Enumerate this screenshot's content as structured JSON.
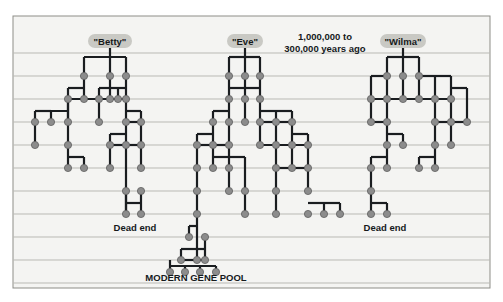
{
  "figure": {
    "title_caption": "Human mitochondrial lineage chart",
    "panel_background": "#f4f4f2",
    "panel_border_color": "#8d8d87",
    "page_background": "#ffffff",
    "gridline_color": "#b9b9b4",
    "branch_color": "#1a1d20",
    "node_fill": "#8c8c8c",
    "node_stroke": "#5f5f5f",
    "pill_fill": "#c9c9c4",
    "pill_text_color": "#16191b",
    "text_color": "#15191c"
  },
  "panel": {
    "x": 13,
    "y": 16,
    "width": 477,
    "height": 272
  },
  "gridlines": {
    "count": 11,
    "y_values": [
      53,
      76,
      99,
      122,
      145,
      168,
      191,
      214,
      237,
      260,
      283
    ],
    "x_start": 13,
    "x_end": 490
  },
  "annotations": [
    {
      "name": "time-span-annotation",
      "lines": [
        "1,000,000 to",
        "300,000 years ago"
      ],
      "x": 325,
      "y": 40,
      "font_size": 9.5,
      "line_height": 12,
      "anchor": "middle"
    },
    {
      "name": "dead-end-label-left",
      "lines": [
        "Dead end"
      ],
      "x": 135,
      "y": 231,
      "font_size": 9.5,
      "line_height": 12,
      "anchor": "middle"
    },
    {
      "name": "dead-end-label-right",
      "lines": [
        "Dead end"
      ],
      "x": 385,
      "y": 231,
      "font_size": 9.5,
      "line_height": 12,
      "anchor": "middle"
    },
    {
      "name": "modern-gene-pool-label",
      "lines": [
        "MODERN GENE POOL"
      ],
      "x": 196,
      "y": 281,
      "font_size": 9.5,
      "line_height": 12,
      "anchor": "middle"
    }
  ],
  "pills": [
    {
      "name": "ancestor-pill-betty",
      "label": "\"Betty\"",
      "cx": 110,
      "cy": 41,
      "w": 44,
      "h": 14
    },
    {
      "name": "ancestor-pill-eve",
      "label": "\"Eve\"",
      "cx": 245,
      "cy": 41,
      "w": 36,
      "h": 14
    },
    {
      "name": "ancestor-pill-wilma",
      "label": "\"Wilma\"",
      "cx": 403,
      "cy": 41,
      "w": 46,
      "h": 14
    }
  ],
  "chart_data": {
    "type": "diagram",
    "diagram_kind": "genealogical-lineage-lattice",
    "title": "MODERN GENE POOL",
    "founders": [
      "\"Betty\"",
      "\"Eve\"",
      "\"Wilma\""
    ],
    "time_range_label": "1,000,000 to 300,000 years ago",
    "generation_rows": 11,
    "row_y": [
      53,
      76,
      99,
      122,
      145,
      168,
      191,
      214,
      237,
      260,
      283
    ],
    "outcomes": [
      "Dead end",
      "MODERN GENE POOL",
      "Dead end"
    ],
    "surviving_lineage": "\"Eve\"",
    "node_radius": 3.6,
    "stem_lines": [
      {
        "x": 110,
        "y1": 48,
        "y2": 57
      },
      {
        "x": 245,
        "y1": 48,
        "y2": 57
      },
      {
        "x": 403,
        "y1": 48,
        "y2": 57
      }
    ],
    "nodes": [
      {
        "x": 84,
        "y": 76
      },
      {
        "x": 110,
        "y": 76
      },
      {
        "x": 126,
        "y": 76
      },
      {
        "x": 68,
        "y": 99
      },
      {
        "x": 84,
        "y": 99
      },
      {
        "x": 99,
        "y": 99
      },
      {
        "x": 110,
        "y": 99
      },
      {
        "x": 118,
        "y": 99
      },
      {
        "x": 126,
        "y": 99
      },
      {
        "x": 35,
        "y": 122
      },
      {
        "x": 51,
        "y": 122
      },
      {
        "x": 68,
        "y": 122
      },
      {
        "x": 99,
        "y": 122
      },
      {
        "x": 126,
        "y": 122
      },
      {
        "x": 141,
        "y": 122
      },
      {
        "x": 35,
        "y": 145
      },
      {
        "x": 68,
        "y": 145
      },
      {
        "x": 110,
        "y": 145
      },
      {
        "x": 126,
        "y": 145
      },
      {
        "x": 141,
        "y": 145
      },
      {
        "x": 68,
        "y": 168
      },
      {
        "x": 84,
        "y": 168
      },
      {
        "x": 110,
        "y": 168
      },
      {
        "x": 141,
        "y": 168
      },
      {
        "x": 126,
        "y": 191
      },
      {
        "x": 141,
        "y": 191
      },
      {
        "x": 126,
        "y": 214
      },
      {
        "x": 141,
        "y": 214
      },
      {
        "x": 229,
        "y": 76
      },
      {
        "x": 245,
        "y": 76
      },
      {
        "x": 260,
        "y": 76
      },
      {
        "x": 229,
        "y": 99
      },
      {
        "x": 245,
        "y": 99
      },
      {
        "x": 260,
        "y": 99
      },
      {
        "x": 213,
        "y": 122
      },
      {
        "x": 229,
        "y": 122
      },
      {
        "x": 245,
        "y": 122
      },
      {
        "x": 260,
        "y": 122
      },
      {
        "x": 276,
        "y": 122
      },
      {
        "x": 292,
        "y": 122
      },
      {
        "x": 197,
        "y": 145
      },
      {
        "x": 213,
        "y": 145
      },
      {
        "x": 229,
        "y": 145
      },
      {
        "x": 260,
        "y": 145
      },
      {
        "x": 276,
        "y": 145
      },
      {
        "x": 292,
        "y": 145
      },
      {
        "x": 308,
        "y": 145
      },
      {
        "x": 197,
        "y": 168
      },
      {
        "x": 213,
        "y": 168
      },
      {
        "x": 229,
        "y": 168
      },
      {
        "x": 276,
        "y": 168
      },
      {
        "x": 292,
        "y": 168
      },
      {
        "x": 308,
        "y": 168
      },
      {
        "x": 197,
        "y": 191
      },
      {
        "x": 229,
        "y": 191
      },
      {
        "x": 245,
        "y": 191
      },
      {
        "x": 276,
        "y": 191
      },
      {
        "x": 308,
        "y": 191
      },
      {
        "x": 197,
        "y": 214
      },
      {
        "x": 245,
        "y": 214
      },
      {
        "x": 276,
        "y": 214
      },
      {
        "x": 308,
        "y": 214
      },
      {
        "x": 324,
        "y": 214
      },
      {
        "x": 340,
        "y": 214
      },
      {
        "x": 189,
        "y": 237
      },
      {
        "x": 205,
        "y": 237
      },
      {
        "x": 181,
        "y": 260
      },
      {
        "x": 197,
        "y": 260
      },
      {
        "x": 205,
        "y": 260
      },
      {
        "x": 170,
        "y": 272
      },
      {
        "x": 185,
        "y": 272
      },
      {
        "x": 200,
        "y": 272
      },
      {
        "x": 216,
        "y": 272
      },
      {
        "x": 387,
        "y": 76
      },
      {
        "x": 403,
        "y": 76
      },
      {
        "x": 419,
        "y": 76
      },
      {
        "x": 371,
        "y": 99
      },
      {
        "x": 387,
        "y": 99
      },
      {
        "x": 403,
        "y": 99
      },
      {
        "x": 419,
        "y": 99
      },
      {
        "x": 435,
        "y": 99
      },
      {
        "x": 451,
        "y": 99
      },
      {
        "x": 371,
        "y": 122
      },
      {
        "x": 387,
        "y": 122
      },
      {
        "x": 435,
        "y": 122
      },
      {
        "x": 451,
        "y": 122
      },
      {
        "x": 467,
        "y": 122
      },
      {
        "x": 387,
        "y": 145
      },
      {
        "x": 403,
        "y": 145
      },
      {
        "x": 435,
        "y": 145
      },
      {
        "x": 451,
        "y": 145
      },
      {
        "x": 371,
        "y": 168
      },
      {
        "x": 387,
        "y": 168
      },
      {
        "x": 419,
        "y": 168
      },
      {
        "x": 435,
        "y": 168
      },
      {
        "x": 371,
        "y": 191
      },
      {
        "x": 371,
        "y": 214
      },
      {
        "x": 387,
        "y": 214
      }
    ],
    "edges": [
      {
        "type": "h",
        "y": 57,
        "x1": 84,
        "x2": 126
      },
      {
        "type": "v",
        "x": 84,
        "y1": 57,
        "y2": 76
      },
      {
        "type": "v",
        "x": 110,
        "y1": 57,
        "y2": 76
      },
      {
        "type": "v",
        "x": 126,
        "y1": 57,
        "y2": 76
      },
      {
        "type": "h",
        "y": 88,
        "x1": 68,
        "x2": 84
      },
      {
        "type": "v",
        "x": 68,
        "y1": 88,
        "y2": 122
      },
      {
        "type": "v",
        "x": 84,
        "y1": 76,
        "y2": 99
      },
      {
        "type": "h",
        "y": 88,
        "x1": 99,
        "x2": 126
      },
      {
        "type": "v",
        "x": 99,
        "y1": 88,
        "y2": 122
      },
      {
        "type": "v",
        "x": 110,
        "y1": 76,
        "y2": 99
      },
      {
        "type": "v",
        "x": 118,
        "y1": 88,
        "y2": 99
      },
      {
        "type": "v",
        "x": 126,
        "y1": 76,
        "y2": 122
      },
      {
        "type": "h",
        "y": 99,
        "x1": 68,
        "x2": 126
      },
      {
        "type": "h",
        "y": 111,
        "x1": 35,
        "x2": 51
      },
      {
        "type": "v",
        "x": 35,
        "y1": 111,
        "y2": 145
      },
      {
        "type": "v",
        "x": 51,
        "y1": 111,
        "y2": 122
      },
      {
        "type": "h",
        "y": 111,
        "x1": 35,
        "x2": 68
      },
      {
        "type": "v",
        "x": 68,
        "y1": 99,
        "y2": 145
      },
      {
        "type": "h",
        "y": 122,
        "x1": 126,
        "x2": 141
      },
      {
        "type": "v",
        "x": 141,
        "y1": 111,
        "y2": 168
      },
      {
        "type": "h",
        "y": 111,
        "x1": 126,
        "x2": 141
      },
      {
        "type": "h",
        "y": 134,
        "x1": 110,
        "x2": 126
      },
      {
        "type": "v",
        "x": 110,
        "y1": 134,
        "y2": 168
      },
      {
        "type": "v",
        "x": 126,
        "y1": 122,
        "y2": 214
      },
      {
        "type": "h",
        "y": 145,
        "x1": 110,
        "x2": 141
      },
      {
        "type": "h",
        "y": 157,
        "x1": 68,
        "x2": 84
      },
      {
        "type": "v",
        "x": 84,
        "y1": 157,
        "y2": 168
      },
      {
        "type": "v",
        "x": 68,
        "y1": 145,
        "y2": 168
      },
      {
        "type": "h",
        "y": 203,
        "x1": 126,
        "x2": 141
      },
      {
        "type": "v",
        "x": 141,
        "y1": 191,
        "y2": 214
      },
      {
        "type": "v",
        "x": 126,
        "y1": 191,
        "y2": 214
      },
      {
        "type": "h",
        "y": 57,
        "x1": 229,
        "x2": 260
      },
      {
        "type": "v",
        "x": 229,
        "y1": 57,
        "y2": 99
      },
      {
        "type": "v",
        "x": 245,
        "y1": 57,
        "y2": 99
      },
      {
        "type": "v",
        "x": 260,
        "y1": 57,
        "y2": 99
      },
      {
        "type": "h",
        "y": 88,
        "x1": 229,
        "x2": 260
      },
      {
        "type": "h",
        "y": 111,
        "x1": 213,
        "x2": 229
      },
      {
        "type": "v",
        "x": 213,
        "y1": 111,
        "y2": 145
      },
      {
        "type": "v",
        "x": 229,
        "y1": 99,
        "y2": 145
      },
      {
        "type": "v",
        "x": 245,
        "y1": 99,
        "y2": 122
      },
      {
        "type": "v",
        "x": 260,
        "y1": 99,
        "y2": 145
      },
      {
        "type": "h",
        "y": 122,
        "x1": 260,
        "x2": 292
      },
      {
        "type": "v",
        "x": 276,
        "y1": 111,
        "y2": 168
      },
      {
        "type": "h",
        "y": 111,
        "x1": 260,
        "x2": 292
      },
      {
        "type": "v",
        "x": 292,
        "y1": 111,
        "y2": 168
      },
      {
        "type": "h",
        "y": 134,
        "x1": 292,
        "x2": 308
      },
      {
        "type": "v",
        "x": 308,
        "y1": 134,
        "y2": 191
      },
      {
        "type": "h",
        "y": 134,
        "x1": 197,
        "x2": 213
      },
      {
        "type": "v",
        "x": 197,
        "y1": 134,
        "y2": 214
      },
      {
        "type": "h",
        "y": 145,
        "x1": 197,
        "x2": 229
      },
      {
        "type": "h",
        "y": 145,
        "x1": 260,
        "x2": 308
      },
      {
        "type": "h",
        "y": 157,
        "x1": 213,
        "x2": 229
      },
      {
        "type": "v",
        "x": 213,
        "y1": 145,
        "y2": 168
      },
      {
        "type": "h",
        "y": 157,
        "x1": 229,
        "x2": 245
      },
      {
        "type": "v",
        "x": 245,
        "y1": 157,
        "y2": 214
      },
      {
        "type": "v",
        "x": 229,
        "y1": 145,
        "y2": 191
      },
      {
        "type": "h",
        "y": 168,
        "x1": 276,
        "x2": 308
      },
      {
        "type": "v",
        "x": 276,
        "y1": 168,
        "y2": 214
      },
      {
        "type": "h",
        "y": 203,
        "x1": 308,
        "x2": 340
      },
      {
        "type": "v",
        "x": 324,
        "y1": 203,
        "y2": 214
      },
      {
        "type": "v",
        "x": 340,
        "y1": 203,
        "y2": 214
      },
      {
        "type": "v",
        "x": 197,
        "y1": 214,
        "y2": 260
      },
      {
        "type": "h",
        "y": 226,
        "x1": 189,
        "x2": 197
      },
      {
        "type": "v",
        "x": 189,
        "y1": 226,
        "y2": 237
      },
      {
        "type": "h",
        "y": 249,
        "x1": 181,
        "x2": 205
      },
      {
        "type": "v",
        "x": 181,
        "y1": 249,
        "y2": 260
      },
      {
        "type": "v",
        "x": 205,
        "y1": 237,
        "y2": 260
      },
      {
        "type": "h",
        "y": 260,
        "x1": 181,
        "x2": 205
      },
      {
        "type": "h",
        "y": 266,
        "x1": 170,
        "x2": 216
      },
      {
        "type": "v",
        "x": 170,
        "y1": 260,
        "y2": 272
      },
      {
        "type": "v",
        "x": 185,
        "y1": 266,
        "y2": 272
      },
      {
        "type": "v",
        "x": 200,
        "y1": 266,
        "y2": 272
      },
      {
        "type": "v",
        "x": 216,
        "y1": 266,
        "y2": 272
      },
      {
        "type": "h",
        "y": 57,
        "x1": 387,
        "x2": 419
      },
      {
        "type": "v",
        "x": 387,
        "y1": 57,
        "y2": 76
      },
      {
        "type": "v",
        "x": 403,
        "y1": 57,
        "y2": 76
      },
      {
        "type": "v",
        "x": 419,
        "y1": 57,
        "y2": 76
      },
      {
        "type": "h",
        "y": 76,
        "x1": 419,
        "x2": 451
      },
      {
        "type": "h",
        "y": 76,
        "x1": 371,
        "x2": 387
      },
      {
        "type": "v",
        "x": 371,
        "y1": 76,
        "y2": 122
      },
      {
        "type": "v",
        "x": 387,
        "y1": 76,
        "y2": 145
      },
      {
        "type": "v",
        "x": 403,
        "y1": 76,
        "y2": 99
      },
      {
        "type": "v",
        "x": 419,
        "y1": 76,
        "y2": 99
      },
      {
        "type": "v",
        "x": 435,
        "y1": 76,
        "y2": 168
      },
      {
        "type": "v",
        "x": 451,
        "y1": 76,
        "y2": 145
      },
      {
        "type": "h",
        "y": 99,
        "x1": 371,
        "x2": 451
      },
      {
        "type": "h",
        "y": 88,
        "x1": 451,
        "x2": 467
      },
      {
        "type": "v",
        "x": 467,
        "y1": 88,
        "y2": 122
      },
      {
        "type": "h",
        "y": 122,
        "x1": 371,
        "x2": 387
      },
      {
        "type": "h",
        "y": 134,
        "x1": 387,
        "x2": 403
      },
      {
        "type": "v",
        "x": 403,
        "y1": 134,
        "y2": 145
      },
      {
        "type": "h",
        "y": 122,
        "x1": 435,
        "x2": 467
      },
      {
        "type": "h",
        "y": 157,
        "x1": 371,
        "x2": 387
      },
      {
        "type": "v",
        "x": 371,
        "y1": 157,
        "y2": 214
      },
      {
        "type": "h",
        "y": 157,
        "x1": 419,
        "x2": 435
      },
      {
        "type": "v",
        "x": 419,
        "y1": 157,
        "y2": 168
      },
      {
        "type": "v",
        "x": 387,
        "y1": 145,
        "y2": 168
      },
      {
        "type": "h",
        "y": 203,
        "x1": 371,
        "x2": 387
      },
      {
        "type": "v",
        "x": 387,
        "y1": 203,
        "y2": 214
      }
    ]
  }
}
